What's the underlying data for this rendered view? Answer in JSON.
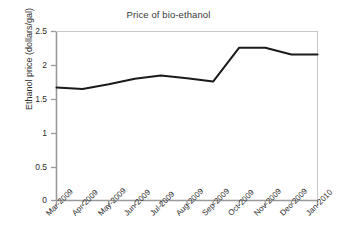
{
  "chart_data": {
    "type": "line",
    "title": "Price of bio-ethanol",
    "xlabel": "",
    "ylabel": "Ethanol price (dollars/gal)",
    "categories": [
      "Mar-2009",
      "Apr-2009",
      "May-2009",
      "Jun-2009",
      "Jul-2009",
      "Aug-2009",
      "Sep-2009",
      "Oct-2009",
      "Nov-2009",
      "Dec-2009",
      "Jan-2010"
    ],
    "values": [
      1.67,
      1.65,
      1.72,
      1.8,
      1.85,
      1.81,
      1.76,
      2.26,
      2.26,
      2.16,
      2.16
    ],
    "ylim": [
      0,
      2.5
    ],
    "yticks": [
      0,
      0.5,
      1,
      1.5,
      2,
      2.5
    ],
    "ytick_labels": [
      "0",
      "0.5",
      "1",
      "1.5",
      "2",
      "2.5"
    ],
    "grid": false,
    "legend": false,
    "line_color": "#1a1a1a",
    "axis_color": "#9a9a9a",
    "background": "#ffffff"
  }
}
